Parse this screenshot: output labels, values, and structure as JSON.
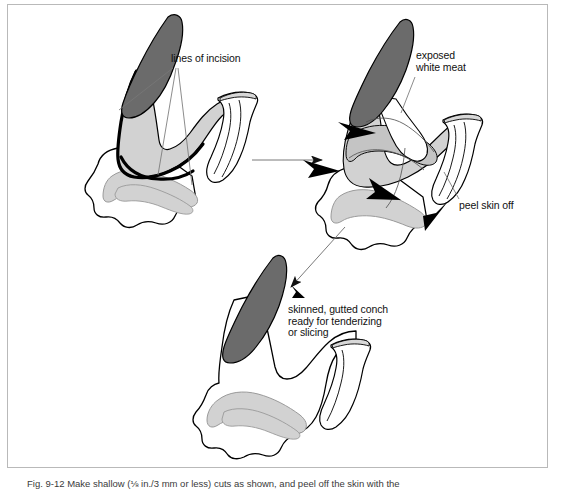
{
  "page": {
    "width": 561,
    "height": 490,
    "background": "#ffffff",
    "frame_border_color": "#b9b9b9"
  },
  "figure": {
    "number": "Fig. 9-12",
    "caption": "Fig. 9-12  Make shallow (⅛ in./3 mm or less) cuts as shown, and peel off the skin with the",
    "panels": [
      {
        "id": "panel-1",
        "name": "conch-with-incision-lines",
        "position": "top-left",
        "description": "Whole conch body showing lines of incision"
      },
      {
        "id": "panel-2",
        "name": "conch-exposed-white-meat",
        "position": "top-right",
        "description": "Conch with skin being peeled back exposing white meat"
      },
      {
        "id": "panel-3",
        "name": "conch-skinned-gutted",
        "position": "bottom-center",
        "description": "Skinned, gutted conch ready for tenderizing or slicing"
      }
    ]
  },
  "labels": {
    "lines_of_incision": "lines of incision",
    "exposed_white_meat": "exposed\nwhite meat",
    "peel_skin_off": "peel skin off",
    "skinned_gutted_conch": "skinned, gutted conch\nready for tenderizing\nor slicing"
  },
  "colors": {
    "outline": "#000000",
    "dark_gray_fill": "#6b6b6b",
    "light_gray_fill": "#d2d2d2",
    "mid_gray_fill": "#bfbfbf",
    "white_fill": "#ffffff",
    "leader_line": "#777777",
    "text": "#111111",
    "caption_text": "#3a3a3a"
  }
}
